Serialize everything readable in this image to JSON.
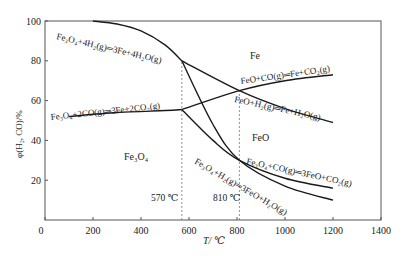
{
  "chart_data": {
    "type": "line",
    "title": "",
    "xlabel": "T/ ℃",
    "ylabel": "φ(H₂, CO)/%",
    "xlim": [
      0,
      1400
    ],
    "ylim": [
      0,
      100
    ],
    "xticks": [
      0,
      200,
      400,
      600,
      800,
      1000,
      1200,
      1400
    ],
    "yticks": [
      0,
      20,
      40,
      60,
      80,
      100
    ],
    "grid": false,
    "legend": "none (inline annotations)",
    "series": [
      {
        "name": "Fe3O4+4H2(g)=3Fe+4H2O(g)",
        "x": [
          200,
          300,
          400,
          500,
          570
        ],
        "y": [
          100,
          98.5,
          95,
          88,
          80
        ]
      },
      {
        "name": "Fe3O4+2CO(g)=3Fe+2CO2(g)",
        "x": [
          100,
          300,
          500,
          570
        ],
        "y": [
          52,
          54,
          55,
          55.5
        ]
      },
      {
        "name": "FeO+CO(g)=Fe+CO2(g)",
        "x": [
          570,
          810,
          1000,
          1200
        ],
        "y": [
          55.5,
          65,
          70,
          73
        ]
      },
      {
        "name": "FeO+H2(g)=Fe+H2O(g)",
        "x": [
          570,
          810,
          1000,
          1200
        ],
        "y": [
          80,
          65,
          56,
          49
        ]
      },
      {
        "name": "Fe3O4+CO(g)=3FeO+CO2(g)",
        "x": [
          570,
          700,
          810,
          1000,
          1200
        ],
        "y": [
          55.5,
          40,
          30,
          21,
          16
        ]
      },
      {
        "name": "Fe3O4+H2(g)=3FeO+H2O(g)",
        "x": [
          570,
          700,
          810,
          1000,
          1200
        ],
        "y": [
          80,
          48,
          30,
          17,
          10
        ]
      }
    ],
    "annotations": [
      {
        "text": "Fe",
        "x": 870,
        "y": 86
      },
      {
        "text": "FeO",
        "x": 830,
        "y": 41
      },
      {
        "text": "Fe₃O₄",
        "x": 400,
        "y": 32
      },
      {
        "text": "570 ℃",
        "x": 480,
        "y": 12
      },
      {
        "text": "810 ℃",
        "x": 720,
        "y": 12
      }
    ],
    "vlines": [
      570,
      810
    ]
  },
  "labels": {
    "y_axis": "φ(H₂, CO)/%",
    "x_axis": "T/ ℃",
    "region_fe": "Fe",
    "region_feo": "FeO",
    "region_fe3o4": "Fe₃O₄",
    "temp_570": "570 ℃",
    "temp_810": "810 ℃",
    "eq1": "Fe₃O₄+4H₂(g)═3Fe+4H₂O(g)",
    "eq2": "Fe₃O₄+2CO(g)═3Fe+2CO₂(g)",
    "eq3": "FeO+CO(g)═Fe+CO₂(g)",
    "eq4": "FeO+H₂(g)═Fe+H₂O(g)",
    "eq5": "Fe₃O₄+CO(g)═3FeO+CO₂(g)",
    "eq6": "Fe₃O₄+H₂(g)═3FeO+H₂O(g)"
  },
  "colors": {
    "line": "#1a1a1a",
    "axis": "#555555",
    "dashed": "#777777",
    "text": "#222222"
  }
}
